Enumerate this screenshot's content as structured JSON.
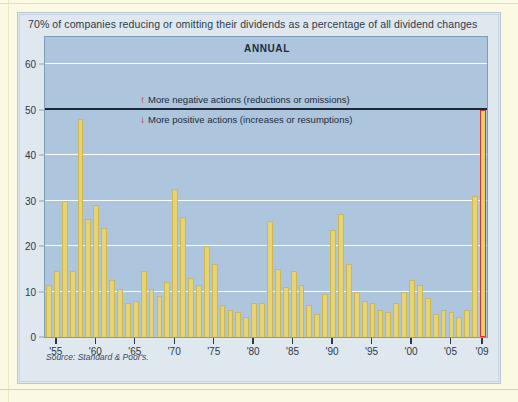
{
  "page": {
    "kicker": "70% of companies reducing or omitting their dividends as a percentage of all dividend changes",
    "panel_title": "ANNUAL",
    "source": "Source: Standard & Poor's."
  },
  "annotations": {
    "up": {
      "icon": "up-arrow-icon",
      "glyph": "↑",
      "text": "More negative actions (reductions or omissions)"
    },
    "down": {
      "icon": "down-arrow-icon",
      "glyph": "↓",
      "text": "More positive actions (increases or resumptions)"
    }
  },
  "colors": {
    "bar": "#e7d371",
    "bar_edge": "#cdb753",
    "highlight": "#d8352c",
    "plot_bg": "#aec6dd",
    "panel_bg": "#dfe7ef",
    "page_bg": "#fbf9e3",
    "grid": "#ffffff",
    "reference_line": "#1b2735",
    "arrow": "#b9252c"
  },
  "chart_data": {
    "type": "bar",
    "title": "ANNUAL",
    "subtitle": "70% of companies reducing or omitting their dividends as a percentage of all dividend changes",
    "xlabel": "",
    "ylabel": "",
    "ylim": [
      0,
      66
    ],
    "yticks": [
      0,
      10,
      20,
      30,
      40,
      50,
      60
    ],
    "ytick_labels": [
      "0",
      "10",
      "20",
      "30",
      "40",
      "50",
      "60"
    ],
    "grid": true,
    "reference_line": 50,
    "legend": "none",
    "xtick_labels": [
      "'55",
      "'60",
      "'65",
      "'70",
      "'75",
      "'80",
      "'85",
      "'90",
      "'95",
      "'00",
      "'05",
      "'09"
    ],
    "xtick_years": [
      1955,
      1960,
      1965,
      1970,
      1975,
      1980,
      1985,
      1990,
      1995,
      2000,
      2005,
      2009
    ],
    "highlight_category": 2009,
    "categories": [
      1954,
      1955,
      1956,
      1957,
      1958,
      1959,
      1960,
      1961,
      1962,
      1963,
      1964,
      1965,
      1966,
      1967,
      1968,
      1969,
      1970,
      1971,
      1972,
      1973,
      1974,
      1975,
      1976,
      1977,
      1978,
      1979,
      1980,
      1981,
      1982,
      1983,
      1984,
      1985,
      1986,
      1987,
      1988,
      1989,
      1990,
      1991,
      1992,
      1993,
      1994,
      1995,
      1996,
      1997,
      1998,
      1999,
      2000,
      2001,
      2002,
      2003,
      2004,
      2005,
      2006,
      2007,
      2008,
      2009
    ],
    "values": [
      11.5,
      14.5,
      30.0,
      14.5,
      48.0,
      26.0,
      29.0,
      24.0,
      12.5,
      10.5,
      7.5,
      8.0,
      14.5,
      10.5,
      9.0,
      12.0,
      32.5,
      26.5,
      13.0,
      11.5,
      20.0,
      16.0,
      7.0,
      6.0,
      5.5,
      4.5,
      7.5,
      7.5,
      25.5,
      15.0,
      11.0,
      14.5,
      11.5,
      7.0,
      5.0,
      9.5,
      23.5,
      27.0,
      16.0,
      10.0,
      8.0,
      7.5,
      6.0,
      5.5,
      7.5,
      10.0,
      12.5,
      11.5,
      8.5,
      5.0,
      6.0,
      5.5,
      4.5,
      6.0,
      31.0,
      50.0
    ]
  }
}
